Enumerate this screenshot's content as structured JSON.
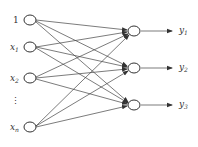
{
  "diagram": {
    "type": "neural-network",
    "inputs": [
      {
        "label": "1",
        "sub": "",
        "y": 20
      },
      {
        "label": "x",
        "sub": "1",
        "y": 47
      },
      {
        "label": "x",
        "sub": "2",
        "y": 78
      },
      {
        "label": "x",
        "sub": "n",
        "y": 127
      }
    ],
    "ellipsis": "⋮",
    "outputs": [
      {
        "label": "y",
        "sub": "1",
        "y": 31
      },
      {
        "label": "y",
        "sub": "2",
        "y": 68
      },
      {
        "label": "y",
        "sub": "3",
        "y": 105
      }
    ],
    "colors": {
      "stroke": "#333333",
      "background": "#ffffff"
    }
  }
}
